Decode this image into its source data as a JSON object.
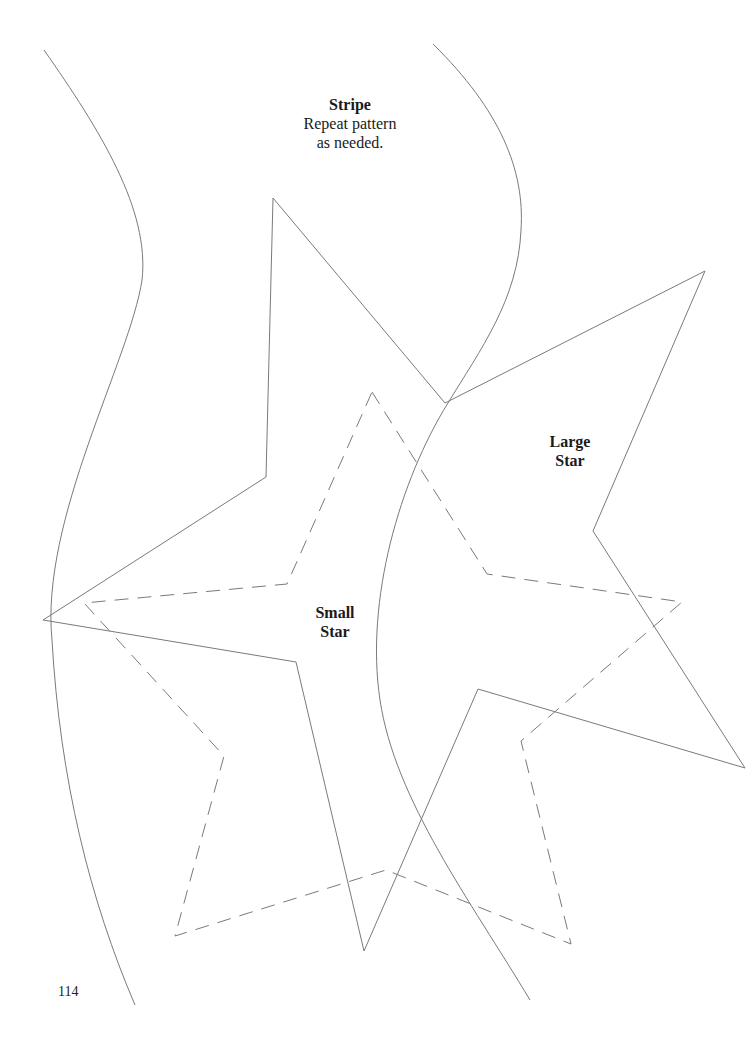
{
  "template": {
    "stripe": {
      "title": "Stripe",
      "line1": "Repeat pattern",
      "line2": "as needed."
    },
    "large_star": {
      "line1": "Large",
      "line2": "Star"
    },
    "small_star": {
      "line1": "Small",
      "line2": "Star"
    }
  },
  "page_number": "114",
  "colors": {
    "line": "#7a7a7a",
    "text": "#1a1a1a",
    "background": "#ffffff"
  }
}
